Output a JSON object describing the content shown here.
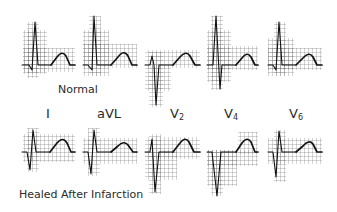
{
  "figure": {
    "sections": [
      {
        "title": "Normal",
        "row": "top"
      },
      {
        "title": "Healed After Infarction",
        "row": "bottom"
      }
    ],
    "leads": [
      {
        "name": "I",
        "main": "I",
        "sub": ""
      },
      {
        "name": "aVL",
        "main": "aVL",
        "sub": ""
      },
      {
        "name": "V2",
        "main": "V",
        "sub": "2"
      },
      {
        "name": "V4",
        "main": "V",
        "sub": "4"
      },
      {
        "name": "V6",
        "main": "V",
        "sub": "6"
      }
    ],
    "normal_label": "Normal",
    "healed_label": "Healed After Infarction",
    "trace_color": "#111111",
    "grid_color": "#555555",
    "background": "#ffffff"
  }
}
